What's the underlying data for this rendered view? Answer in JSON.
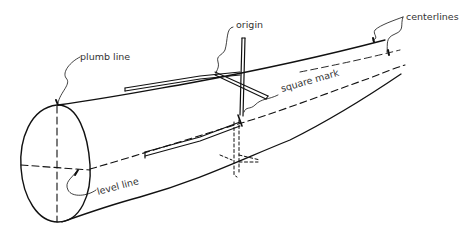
{
  "diagram": {
    "labels": {
      "plumb_line": "plumb line",
      "origin": "origin",
      "square_mark": "square mark",
      "centerlines": "centerlines",
      "level_line": "level line"
    },
    "colors": {
      "ink": "#111111",
      "text": "#333333",
      "background": "#ffffff"
    }
  }
}
